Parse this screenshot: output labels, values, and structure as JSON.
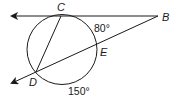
{
  "diagram": {
    "type": "circle-secant-tangent",
    "points": {
      "C": {
        "label": "C"
      },
      "B": {
        "label": "B"
      },
      "E": {
        "label": "E"
      },
      "D": {
        "label": "D"
      }
    },
    "arcs": {
      "CE": {
        "label": "80°"
      },
      "DE": {
        "label": "150°"
      }
    },
    "colors": {
      "stroke": "#1a1a1a",
      "background": "#ffffff"
    }
  }
}
